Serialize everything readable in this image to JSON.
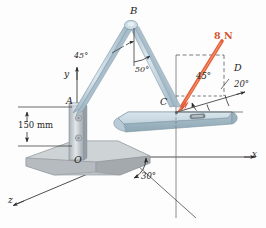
{
  "figure": {
    "background_color": "#fdfdfd"
  },
  "colors": {
    "force_arrow": "#e4603a",
    "force_label": "#d2552f",
    "plate_top": "#c9d9e1",
    "plate_front": "#9fb6c2",
    "plate_edge": "#7e97a5",
    "boom": "#b9ccd8",
    "boom_dark": "#8ba4b3",
    "base_block": "#c2c6c9",
    "base_block_dark": "#9aa0a4",
    "axis": "#3a3a3a",
    "dashed": "#5a5a5a",
    "label_text": "#1c1c1c"
  },
  "axes": [
    {
      "name": "y-axis",
      "label": "y"
    },
    {
      "name": "x-axis",
      "label": "x"
    },
    {
      "name": "z-axis",
      "label": "z"
    }
  ],
  "points": [
    {
      "name": "point-A",
      "label": "A"
    },
    {
      "name": "point-B",
      "label": "B"
    },
    {
      "name": "point-C",
      "label": "C"
    },
    {
      "name": "point-D",
      "label": "D"
    },
    {
      "name": "point-O",
      "label": "O"
    }
  ],
  "labels": {
    "y_axis": "y",
    "x_axis": "x",
    "z_axis": "z",
    "point_a": "A",
    "point_b": "B",
    "point_c": "C",
    "point_d": "D",
    "origin_o": "O"
  },
  "angles": {
    "boom_upper": "45°",
    "boom_apex": "50°",
    "force_elevation": "45°",
    "line_cd": "20°",
    "z_ground": "30°"
  },
  "dimensions": {
    "height_oa": "150 mm"
  },
  "force": {
    "magnitude": "8 N",
    "applied_at": "C",
    "direction_label": "8 N"
  }
}
